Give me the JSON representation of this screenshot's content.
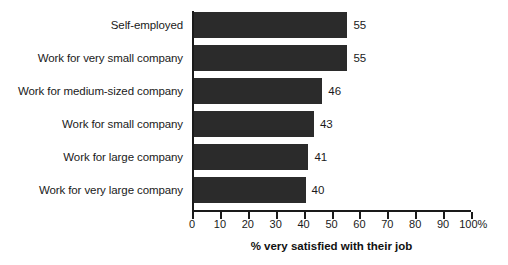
{
  "chart_data": {
    "type": "bar",
    "orientation": "horizontal",
    "title": "",
    "xlabel": "% very satisfied with their job",
    "ylabel": "",
    "categories": [
      "Self-employed",
      "Work for very small company",
      "Work for medium-sized company",
      "Work for small company",
      "Work for large company",
      "Work for very large company"
    ],
    "values": [
      55,
      55,
      46,
      43,
      41,
      40
    ],
    "value_labels": [
      "55",
      "55",
      "46",
      "43",
      "41",
      "40"
    ],
    "xlim": [
      0,
      100
    ],
    "xticks": [
      0,
      10,
      20,
      30,
      40,
      50,
      60,
      70,
      80,
      90,
      100
    ],
    "xtick_labels": [
      "0",
      "10",
      "20",
      "30",
      "40",
      "50",
      "60",
      "70",
      "80",
      "90",
      "100%"
    ],
    "grid": false,
    "legend": null,
    "bar_color": "#2b2b2b",
    "axis_color": "#1a1a1a",
    "background": "#ffffff"
  }
}
